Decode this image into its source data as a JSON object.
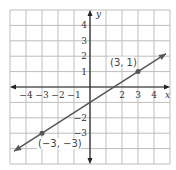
{
  "chart_data": {
    "type": "line",
    "title": "",
    "xlabel": "x",
    "ylabel": "y",
    "xlim": [
      -5,
      5
    ],
    "ylim": [
      -5,
      5
    ],
    "grid": true,
    "x_ticks": [
      "-4",
      "-3",
      "-2",
      "-1",
      "2",
      "3",
      "4"
    ],
    "y_ticks": [
      "4",
      "3",
      "2",
      "1",
      "-2",
      "-3"
    ],
    "line": {
      "slope": 0.6667,
      "intercept": -1,
      "equation": "y = (2/3)x - 1"
    },
    "points": [
      {
        "x": 3,
        "y": 1,
        "label": "(3, 1)"
      },
      {
        "x": -3,
        "y": -3,
        "label": "(−3, −3)"
      }
    ],
    "colors": {
      "grid": "#bdbdbd",
      "axis": "#222222",
      "line": "#555555"
    }
  }
}
